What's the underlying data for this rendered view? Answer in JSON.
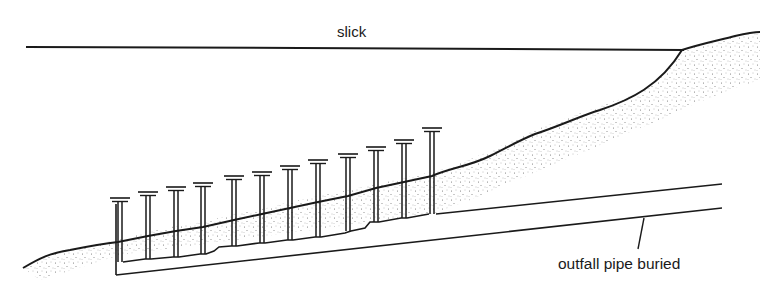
{
  "diagram": {
    "labels": {
      "slick": "slick",
      "outfall": "outfall pipe buried"
    },
    "colors": {
      "ink": "#1a1a1a",
      "stipple": "#555555",
      "background": "#ffffff"
    },
    "wellpoint_count": 12,
    "wellpoints": [
      {
        "x": 120,
        "cap_y": 198,
        "bottom_y": 262
      },
      {
        "x": 148,
        "cap_y": 192,
        "bottom_y": 259
      },
      {
        "x": 176,
        "cap_y": 187,
        "bottom_y": 257
      },
      {
        "x": 203,
        "cap_y": 183,
        "bottom_y": 254
      },
      {
        "x": 234,
        "cap_y": 176,
        "bottom_y": 246
      },
      {
        "x": 262,
        "cap_y": 172,
        "bottom_y": 243
      },
      {
        "x": 290,
        "cap_y": 166,
        "bottom_y": 240
      },
      {
        "x": 318,
        "cap_y": 160,
        "bottom_y": 237
      },
      {
        "x": 348,
        "cap_y": 154,
        "bottom_y": 231
      },
      {
        "x": 376,
        "cap_y": 147,
        "bottom_y": 222
      },
      {
        "x": 404,
        "cap_y": 140,
        "bottom_y": 218
      },
      {
        "x": 432,
        "cap_y": 128,
        "bottom_y": 214
      }
    ]
  }
}
